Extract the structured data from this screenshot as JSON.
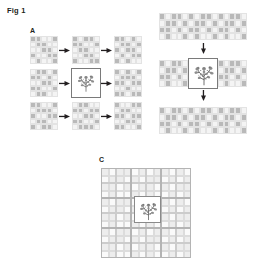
{
  "figure": {
    "title": "Fig 1",
    "background_color": "#ffffff",
    "text_color": "#231f20",
    "width": 255,
    "height": 272
  },
  "palette": {
    "cell_on": "#b9b9b9",
    "cell_off": "#f4f4f4",
    "cell_border": "#e3e3e3",
    "highlight_border": "#7a7a7a",
    "arrow": "#231f20",
    "panel_c_on": "#ededed",
    "panel_c_off": "#fafafa",
    "panel_c_grid_fine": "#dcdcdc",
    "panel_c_grid_mid": "#cccccc",
    "panel_c_grid_coarse": "#b4b4b4"
  },
  "panels": {
    "a": {
      "label": "A",
      "layout": "3x3 array of 5x5 patch grids connected by rightward arrows",
      "rows": 3,
      "cols": 3,
      "grid_rows": 5,
      "grid_cols": 5,
      "arrow_icon": "arrow-right-icon",
      "highlight": {
        "row": 1,
        "col": 1,
        "contains": "plant-icon"
      },
      "patches": [
        [
          [
            [
              1,
              1,
              0,
              0,
              1
            ],
            [
              0,
              1,
              1,
              0,
              0
            ],
            [
              0,
              0,
              1,
              1,
              0
            ],
            [
              1,
              0,
              0,
              1,
              1
            ],
            [
              0,
              1,
              0,
              0,
              1
            ]
          ],
          [
            [
              1,
              0,
              1,
              1,
              0
            ],
            [
              1,
              1,
              0,
              0,
              1
            ],
            [
              0,
              1,
              1,
              0,
              0
            ],
            [
              0,
              0,
              1,
              1,
              0
            ],
            [
              1,
              0,
              0,
              1,
              1
            ]
          ],
          [
            [
              1,
              1,
              0,
              1,
              0
            ],
            [
              0,
              1,
              1,
              0,
              1
            ],
            [
              1,
              0,
              1,
              1,
              0
            ],
            [
              0,
              1,
              0,
              1,
              1
            ],
            [
              1,
              0,
              1,
              0,
              0
            ]
          ]
        ],
        [
          [
            [
              0,
              1,
              1,
              0,
              1
            ],
            [
              1,
              1,
              0,
              1,
              0
            ],
            [
              0,
              0,
              1,
              1,
              0
            ],
            [
              1,
              1,
              0,
              0,
              1
            ],
            [
              0,
              1,
              1,
              0,
              0
            ]
          ],
          null,
          [
            [
              1,
              0,
              1,
              0,
              1
            ],
            [
              0,
              1,
              1,
              1,
              0
            ],
            [
              1,
              1,
              0,
              1,
              1
            ],
            [
              0,
              0,
              1,
              0,
              0
            ],
            [
              1,
              1,
              0,
              1,
              1
            ]
          ]
        ],
        [
          [
            [
              1,
              1,
              0,
              0,
              1
            ],
            [
              0,
              1,
              1,
              1,
              0
            ],
            [
              1,
              0,
              0,
              1,
              1
            ],
            [
              0,
              1,
              1,
              0,
              0
            ],
            [
              1,
              0,
              1,
              1,
              0
            ]
          ],
          [
            [
              0,
              1,
              1,
              0,
              0
            ],
            [
              1,
              1,
              0,
              1,
              1
            ],
            [
              0,
              0,
              1,
              1,
              0
            ],
            [
              1,
              1,
              0,
              0,
              1
            ],
            [
              0,
              1,
              1,
              1,
              0
            ]
          ],
          [
            [
              1,
              0,
              0,
              1,
              1
            ],
            [
              0,
              1,
              1,
              0,
              0
            ],
            [
              1,
              1,
              0,
              1,
              1
            ],
            [
              0,
              0,
              1,
              1,
              0
            ],
            [
              1,
              1,
              0,
              0,
              1
            ]
          ]
        ]
      ]
    },
    "b": {
      "label": "B",
      "layout": "three wide grid strips stacked vertically, connected by downward arrows",
      "strips": 3,
      "grid_rows": 4,
      "grid_cols": 15,
      "arrow_icon": "arrow-down-icon",
      "highlight": {
        "strip": 1,
        "contains": "plant-icon"
      },
      "rows_data": [
        [
          [
            1,
            0,
            1,
            1,
            0,
            1,
            0,
            1,
            1,
            0,
            1,
            0,
            1,
            1,
            0
          ],
          [
            0,
            1,
            1,
            0,
            1,
            0,
            1,
            1,
            0,
            1,
            0,
            1,
            1,
            0,
            1
          ],
          [
            1,
            1,
            0,
            1,
            0,
            1,
            1,
            0,
            1,
            0,
            1,
            1,
            0,
            1,
            0
          ],
          [
            0,
            1,
            0,
            0,
            1,
            0,
            1,
            0,
            0,
            1,
            0,
            1,
            0,
            0,
            1
          ]
        ],
        [
          [
            1,
            0,
            1,
            1,
            0,
            1,
            0,
            1,
            1,
            0,
            1,
            0,
            1,
            1,
            0
          ],
          [
            0,
            1,
            1,
            0,
            1,
            0,
            1,
            1,
            0,
            1,
            0,
            1,
            1,
            0,
            1
          ],
          [
            1,
            1,
            0,
            1,
            0,
            1,
            1,
            0,
            1,
            0,
            1,
            1,
            0,
            1,
            0
          ],
          [
            0,
            1,
            0,
            0,
            1,
            0,
            1,
            0,
            0,
            1,
            0,
            1,
            0,
            0,
            1
          ]
        ],
        [
          [
            1,
            0,
            1,
            1,
            0,
            1,
            0,
            1,
            1,
            0,
            1,
            0,
            1,
            1,
            0
          ],
          [
            0,
            1,
            1,
            0,
            1,
            0,
            1,
            1,
            0,
            1,
            0,
            1,
            1,
            0,
            1
          ],
          [
            1,
            1,
            0,
            1,
            0,
            1,
            1,
            0,
            1,
            0,
            1,
            1,
            0,
            1,
            0
          ],
          [
            0,
            1,
            0,
            0,
            1,
            0,
            1,
            0,
            0,
            1,
            0,
            1,
            0,
            0,
            1
          ]
        ]
      ]
    },
    "c": {
      "label": "C",
      "layout": "single large multi-scale grid with nested coarser grid lines and a highlighted plant box near the centre",
      "fine_rows": 12,
      "fine_cols": 12,
      "mid_rows": 6,
      "mid_cols": 6,
      "coarse_rows": 3,
      "coarse_cols": 3,
      "highlight": {
        "contains": "plant-icon"
      },
      "fine_data": [
        [
          1,
          0,
          1,
          1,
          0,
          1,
          0,
          1,
          1,
          0,
          1,
          0
        ],
        [
          0,
          1,
          1,
          0,
          1,
          0,
          1,
          1,
          0,
          1,
          0,
          1
        ],
        [
          1,
          1,
          0,
          1,
          0,
          1,
          1,
          0,
          1,
          0,
          1,
          1
        ],
        [
          0,
          1,
          0,
          0,
          1,
          0,
          1,
          0,
          0,
          1,
          0,
          1
        ],
        [
          1,
          0,
          1,
          1,
          0,
          1,
          0,
          1,
          1,
          0,
          1,
          0
        ],
        [
          0,
          1,
          1,
          0,
          1,
          0,
          1,
          1,
          0,
          1,
          0,
          1
        ],
        [
          1,
          1,
          0,
          1,
          0,
          1,
          1,
          0,
          1,
          0,
          1,
          1
        ],
        [
          0,
          1,
          0,
          0,
          1,
          0,
          1,
          0,
          0,
          1,
          0,
          1
        ],
        [
          1,
          0,
          1,
          1,
          0,
          1,
          0,
          1,
          1,
          0,
          1,
          0
        ],
        [
          0,
          1,
          1,
          0,
          1,
          0,
          1,
          1,
          0,
          1,
          0,
          1
        ],
        [
          1,
          1,
          0,
          1,
          0,
          1,
          1,
          0,
          1,
          0,
          1,
          1
        ],
        [
          0,
          1,
          0,
          0,
          1,
          0,
          1,
          0,
          0,
          1,
          0,
          1
        ]
      ]
    }
  },
  "icons": {
    "plant": "plant-icon",
    "arrow_right": "arrow-right-icon",
    "arrow_down": "arrow-down-icon"
  }
}
